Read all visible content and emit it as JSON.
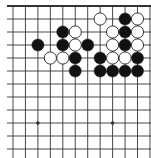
{
  "board": {
    "description": "Go board fragment (top edge visible, cropped left/right/bottom)",
    "colors": {
      "background": "#ffffff",
      "line": "#333333",
      "black_stone": "#111111",
      "white_stone": "#ffffff",
      "stone_outline": "#222222"
    },
    "grid": {
      "x0": 13,
      "dx": 12.45,
      "cols": 12,
      "y0": 6,
      "dy": 13.0,
      "rows": 12,
      "top_edge_visible": true,
      "line_extent": {
        "left": 7,
        "right": 151,
        "bottom": 158
      }
    },
    "star_points": [
      {
        "col": 2,
        "row": 9
      },
      {
        "col": 8,
        "row": 9
      }
    ],
    "stones": [
      {
        "col": 7,
        "row": 1,
        "color": "white"
      },
      {
        "col": 9,
        "row": 1,
        "color": "black"
      },
      {
        "col": 10,
        "row": 1,
        "color": "white"
      },
      {
        "col": 4,
        "row": 2,
        "color": "black"
      },
      {
        "col": 5,
        "row": 2,
        "color": "white"
      },
      {
        "col": 8,
        "row": 2,
        "color": "white"
      },
      {
        "col": 9,
        "row": 2,
        "color": "black"
      },
      {
        "col": 10,
        "row": 2,
        "color": "white"
      },
      {
        "col": 2,
        "row": 3,
        "color": "black"
      },
      {
        "col": 4,
        "row": 3,
        "color": "black"
      },
      {
        "col": 5,
        "row": 3,
        "color": "white"
      },
      {
        "col": 6,
        "row": 3,
        "color": "black"
      },
      {
        "col": 8,
        "row": 3,
        "color": "white"
      },
      {
        "col": 9,
        "row": 3,
        "color": "black"
      },
      {
        "col": 10,
        "row": 3,
        "color": "white"
      },
      {
        "col": 3,
        "row": 4,
        "color": "white"
      },
      {
        "col": 4,
        "row": 4,
        "color": "white"
      },
      {
        "col": 5,
        "row": 4,
        "color": "black"
      },
      {
        "col": 7,
        "row": 4,
        "color": "black"
      },
      {
        "col": 8,
        "row": 4,
        "color": "white"
      },
      {
        "col": 9,
        "row": 4,
        "color": "white"
      },
      {
        "col": 10,
        "row": 4,
        "color": "black"
      },
      {
        "col": 5,
        "row": 5,
        "color": "black"
      },
      {
        "col": 7,
        "row": 5,
        "color": "black"
      },
      {
        "col": 8,
        "row": 5,
        "color": "black"
      },
      {
        "col": 9,
        "row": 5,
        "color": "black"
      },
      {
        "col": 10,
        "row": 5,
        "color": "black"
      }
    ]
  }
}
